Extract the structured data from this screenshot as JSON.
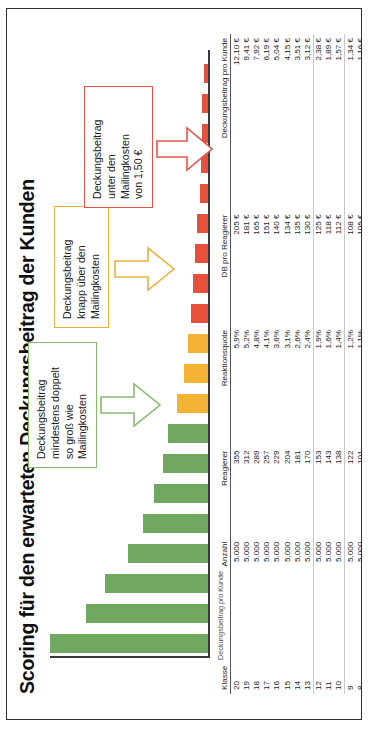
{
  "chart_title": "Scoring für den erwarteten Deckungsbeitrag der Kunden",
  "axis_caption": "Deckungsbeitrag pro Kunde",
  "colors": {
    "green": "#70a860",
    "orange": "#f5b335",
    "red": "#e8503a",
    "callout_green": "#8bba6e",
    "callout_orange": "#e8b23c",
    "callout_red": "#e1554a",
    "axis": "#3a3a3a"
  },
  "callouts": [
    {
      "id": "callout-green",
      "border_color": "#8bba6e",
      "lines": [
        "Deckungsbeitrag",
        "mindestens doppelt",
        "so groß wie",
        "Mailingkosten"
      ]
    },
    {
      "id": "callout-orange",
      "border_color": "#e8b23c",
      "lines": [
        "Deckungsbeitrag",
        "knapp über den",
        "Mailingkosten"
      ]
    },
    {
      "id": "callout-red",
      "border_color": "#e1554a",
      "lines": [
        "Deckungsbeitrag",
        "unter den",
        "Mailingkosten",
        "von 1,50 €"
      ]
    }
  ],
  "table": {
    "headers": [
      "Klasse",
      "Anzahl",
      "Reagierer",
      "Reaktionsquote",
      "DB pro Reagierer",
      "Deckungsbeitrag pro Kunde"
    ],
    "rows": [
      {
        "klasse": "20",
        "anzahl": "5.000",
        "reagierer": "355",
        "quote": "5,9%",
        "db_reagierer": "205 €",
        "db_kunde": "12,10 €"
      },
      {
        "klasse": "19",
        "anzahl": "5.000",
        "reagierer": "312",
        "quote": "5,2%",
        "db_reagierer": "181 €",
        "db_kunde": "9,41 €"
      },
      {
        "klasse": "18",
        "anzahl": "5.000",
        "reagierer": "289",
        "quote": "4,8%",
        "db_reagierer": "165 €",
        "db_kunde": "7,92 €"
      },
      {
        "klasse": "17",
        "anzahl": "5.000",
        "reagierer": "257",
        "quote": "4,1%",
        "db_reagierer": "151 €",
        "db_kunde": "6,19 €"
      },
      {
        "klasse": "16",
        "anzahl": "5.000",
        "reagierer": "229",
        "quote": "3,6%",
        "db_reagierer": "140 €",
        "db_kunde": "5,04 €"
      },
      {
        "klasse": "15",
        "anzahl": "5.000",
        "reagierer": "204",
        "quote": "3,1%",
        "db_reagierer": "134 €",
        "db_kunde": "4,15 €"
      },
      {
        "klasse": "14",
        "anzahl": "5.000",
        "reagierer": "181",
        "quote": "2,6%",
        "db_reagierer": "135 €",
        "db_kunde": "3,51 €"
      },
      {
        "klasse": "13",
        "anzahl": "5.000",
        "reagierer": "170",
        "quote": "2,4%",
        "db_reagierer": "130 €",
        "db_kunde": "3,12 €"
      },
      {
        "klasse": "12",
        "anzahl": "5.000",
        "reagierer": "153",
        "quote": "1,9%",
        "db_reagierer": "125 €",
        "db_kunde": "2,38 €"
      },
      {
        "klasse": "11",
        "anzahl": "5.000",
        "reagierer": "143",
        "quote": "1,6%",
        "db_reagierer": "118 €",
        "db_kunde": "1,89 €"
      },
      {
        "klasse": "10",
        "anzahl": "5.000",
        "reagierer": "138",
        "quote": "1,4%",
        "db_reagierer": "112 €",
        "db_kunde": "1,57 €"
      },
      {
        "klasse": "9",
        "anzahl": "5.000",
        "reagierer": "122",
        "quote": "1,2%",
        "db_reagierer": "108 €",
        "db_kunde": "1,34 €"
      },
      {
        "klasse": "8",
        "anzahl": "5.000",
        "reagierer": "101",
        "quote": "1,1%",
        "db_reagierer": "105 €",
        "db_kunde": "1,16 €"
      },
      {
        "klasse": "7",
        "anzahl": "5.000",
        "reagierer": "89",
        "quote": "1,0%",
        "db_reagierer": "106 €",
        "db_kunde": "1,06 €"
      },
      {
        "klasse": "6",
        "anzahl": "5.000",
        "reagierer": "79",
        "quote": "0,9%",
        "db_reagierer": "95 €",
        "db_kunde": "0,86 €"
      },
      {
        "klasse": "5",
        "anzahl": "5.000",
        "reagierer": "71",
        "quote": "0,8%",
        "db_reagierer": "85 €",
        "db_kunde": "0,68 €"
      },
      {
        "klasse": "4",
        "anzahl": "5.000",
        "reagierer": "57",
        "quote": "0,7%",
        "db_reagierer": "83 €",
        "db_kunde": "0,58 €"
      },
      {
        "klasse": "3",
        "anzahl": "5.000",
        "reagierer": "48",
        "quote": "0,6%",
        "db_reagierer": "82 €",
        "db_kunde": "0,52 €"
      },
      {
        "klasse": "2",
        "anzahl": "5.000",
        "reagierer": "39",
        "quote": "0,6%",
        "db_reagierer": "78 €",
        "db_kunde": "0,47 €"
      },
      {
        "klasse": "1",
        "anzahl": "5.000",
        "reagierer": "34",
        "quote": "0,5%",
        "db_reagierer": "68 €",
        "db_kunde": "0,34 €"
      }
    ],
    "total": {
      "klasse": "",
      "anzahl": "100.000",
      "reagierer": "3.071",
      "quote": "3,1%",
      "db_reagierer": "105 €",
      "db_kunde": "3,21 €"
    }
  },
  "chart_data": {
    "type": "bar",
    "title": "Scoring für den erwarteten Deckungsbeitrag der Kunden",
    "xlabel": "Klasse",
    "ylabel": "Deckungsbeitrag pro Kunde",
    "ylim": [
      0,
      12.1
    ],
    "grid": false,
    "legend": false,
    "categories": [
      "20",
      "19",
      "18",
      "17",
      "16",
      "15",
      "14",
      "13",
      "12",
      "11",
      "10",
      "9",
      "8",
      "7",
      "6",
      "5",
      "4",
      "3",
      "2",
      "1"
    ],
    "values": [
      12.1,
      9.41,
      7.92,
      6.19,
      5.04,
      4.15,
      3.51,
      3.12,
      2.38,
      1.89,
      1.57,
      1.34,
      1.16,
      1.06,
      0.86,
      0.68,
      0.58,
      0.52,
      0.47,
      0.34
    ],
    "bar_colors": [
      "#70a860",
      "#70a860",
      "#70a860",
      "#70a860",
      "#70a860",
      "#70a860",
      "#70a860",
      "#70a860",
      "#f5b335",
      "#f5b335",
      "#f5b335",
      "#e8503a",
      "#e8503a",
      "#e8503a",
      "#e8503a",
      "#e8503a",
      "#e8503a",
      "#e8503a",
      "#e8503a",
      "#e8503a"
    ],
    "annotations": [
      "Deckungsbeitrag mindestens doppelt so groß wie Mailingkosten",
      "Deckungsbeitrag knapp über den Mailingkosten",
      "Deckungsbeitrag unter den Mailingkosten von 1,50 €"
    ]
  }
}
